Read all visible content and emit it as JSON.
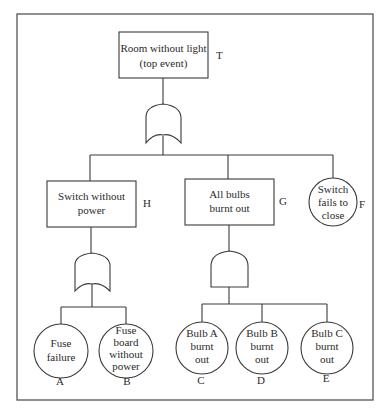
{
  "diagram": {
    "type": "fault-tree",
    "colors": {
      "line": "#3a3a3a",
      "text": "#2a2a2a",
      "background": "#ffffff"
    },
    "top_event": {
      "id": "T",
      "label": "T",
      "lines": [
        "Room without light",
        "(top event)"
      ]
    },
    "top_gate": {
      "type": "OR",
      "icon": "or-gate-icon"
    },
    "level2": {
      "H": {
        "id": "H",
        "label": "H",
        "lines": [
          "Switch without",
          "power"
        ],
        "shape": "rectangle"
      },
      "G": {
        "id": "G",
        "label": "G",
        "lines": [
          "All bulbs",
          "burnt out"
        ],
        "shape": "rectangle"
      },
      "F": {
        "id": "F",
        "label": "F",
        "lines": [
          "Switch",
          "fails to",
          "close"
        ],
        "shape": "circle"
      }
    },
    "gate_H": {
      "type": "OR",
      "icon": "or-gate-icon"
    },
    "gate_G": {
      "type": "AND",
      "icon": "and-gate-icon"
    },
    "basic_events": {
      "A": {
        "id": "A",
        "label": "A",
        "lines": [
          "Fuse",
          "failure"
        ]
      },
      "B": {
        "id": "B",
        "label": "B",
        "lines": [
          "Fuse",
          "board",
          "without",
          "power"
        ]
      },
      "C": {
        "id": "C",
        "label": "C",
        "lines": [
          "Bulb A",
          "burnt",
          "out"
        ]
      },
      "D": {
        "id": "D",
        "label": "D",
        "lines": [
          "Bulb B",
          "burnt",
          "out"
        ]
      },
      "E": {
        "id": "E",
        "label": "E",
        "lines": [
          "Bulb C",
          "burnt",
          "out"
        ]
      }
    }
  }
}
